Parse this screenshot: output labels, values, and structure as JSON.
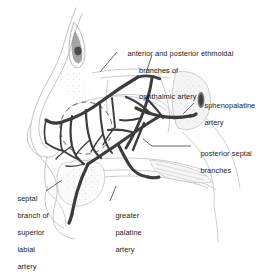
{
  "figure": {
    "background_color": "#ffffff",
    "artery_color": "#3c3c3c",
    "outline_color": "#b9b9b9",
    "leader_color": "#555555",
    "text_color": "#1a1a1a",
    "width": 277,
    "height": 252
  },
  "labels": {
    "ethmoidal": {
      "line1": "anterior and posterior ethmoidal",
      "line2": "branches of",
      "line3": "ophthalmic artery"
    },
    "sphenopalatine": {
      "line1": "sphenopalatine",
      "line2": "artery"
    },
    "posterior_septal": {
      "line1": "posterior septal",
      "line2": "branches"
    },
    "septal_branch_superior_labial": {
      "line1": "septal",
      "line2": "branch of",
      "line3": "superior",
      "line4": "labial",
      "line5": "artery"
    },
    "greater_palatine": {
      "line1": "greater",
      "line2": "palatine",
      "line3": "artery"
    }
  },
  "structures": [
    "frontal-sinus",
    "nasal-dorsum",
    "nasal-septum",
    "sphenoid-sinus",
    "hard-palate",
    "incisive-canal",
    "kiesselbach-plexus-region"
  ]
}
